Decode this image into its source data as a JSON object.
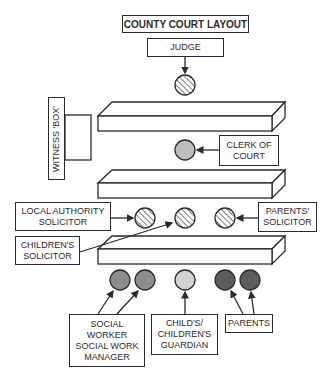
{
  "title": "COUNTY COURT LAYOUT",
  "labels": {
    "judge": "JUDGE",
    "witness_box": "WITNESS 'BOX'",
    "clerk": [
      "CLERK OF",
      "COURT"
    ],
    "local_authority_solicitor": [
      "LOCAL AUTHORITY",
      "SOLICITOR"
    ],
    "childrens_solicitor": [
      "CHILDREN'S",
      "SOLICITOR"
    ],
    "parents_solicitor": [
      "PARENTS'",
      "SOLICITOR"
    ],
    "social_worker": [
      "SOCIAL",
      "WORKER",
      "SOCIAL WORK",
      "MANAGER"
    ],
    "guardian": [
      "CHILD'S/",
      "CHILDREN'S",
      "GUARDIAN"
    ],
    "parents": "PARENTS"
  },
  "colors": {
    "line": "#2a2a2a",
    "hatched_fill": "#ffffff",
    "clerk_fill": "#bdbdbd",
    "social_worker_fill": "#8c8c8c",
    "guardian_fill": "#d2d2d2",
    "parents_fill": "#5c5c5c"
  }
}
